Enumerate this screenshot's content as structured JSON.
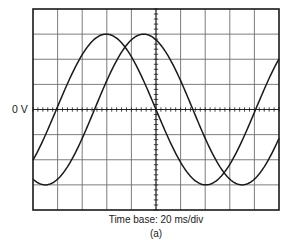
{
  "figure": {
    "zero_axis_label": "0 V",
    "timebase_caption": "Time base: 20 ms/div",
    "figure_label": "(a)"
  },
  "colors": {
    "background": "#ffffff",
    "frame": "#1a1a1a",
    "grid": "#6e6e6e",
    "trace": "#1a1a1a"
  },
  "screen": {
    "x": 33,
    "y": 9,
    "width": 246,
    "height": 201,
    "divisions_x": 10,
    "divisions_y": 8,
    "minor_ticks_per_division": 5
  },
  "chart_data": {
    "type": "line",
    "title": "",
    "xlabel": "Time base: 20 ms/div",
    "ylabel": "0 V",
    "x_unit": "divisions (20 ms/div)",
    "y_unit": "divisions",
    "xlim": [
      0,
      10
    ],
    "ylim": [
      -4,
      4
    ],
    "grid": true,
    "time_per_division_ms": 20,
    "series": [
      {
        "name": "Trace 1 (leading)",
        "amplitude_div": 3.0,
        "period_div": 8.1,
        "period_ms": 162,
        "zero_crossings_rising_div": [
          0.95,
          9.0
        ],
        "zero_crossings_falling_div": [
          5.0
        ],
        "peak_div": [
          3.0
        ],
        "trough_div": [
          6.95
        ],
        "x": [
          0,
          0.5,
          0.95,
          1.5,
          2,
          2.5,
          3,
          3.5,
          4,
          4.5,
          5,
          5.5,
          6,
          6.5,
          6.95,
          7.5,
          8,
          8.5,
          9,
          9.5,
          10
        ],
        "y": [
          -2.0,
          -1.0,
          0.0,
          1.2,
          2.1,
          2.75,
          3.0,
          2.8,
          2.2,
          1.25,
          0.0,
          -1.15,
          -2.15,
          -2.8,
          -3.0,
          -2.75,
          -2.1,
          -1.2,
          0.0,
          1.15,
          2.1
        ]
      },
      {
        "name": "Trace 2 (lagging)",
        "amplitude_div": 3.0,
        "period_div": 8.0,
        "period_ms": 160,
        "zero_crossings_rising_div": [
          2.5
        ],
        "zero_crossings_falling_div": [
          6.6
        ],
        "peak_div": [
          4.6
        ],
        "trough_div": [
          0.7,
          8.4
        ],
        "x": [
          0,
          0.35,
          0.7,
          1.2,
          1.8,
          2.5,
          3.0,
          3.5,
          4.0,
          4.6,
          5.2,
          5.8,
          6.6,
          7.2,
          7.8,
          8.4,
          9.0,
          9.5,
          10
        ],
        "y": [
          -2.6,
          -2.9,
          -3.0,
          -2.75,
          -1.85,
          0.0,
          1.3,
          2.3,
          2.85,
          3.0,
          2.75,
          1.95,
          0.0,
          -1.5,
          -2.6,
          -3.0,
          -2.75,
          -2.15,
          -1.25
        ]
      }
    ],
    "phase_difference_div": 1.6,
    "phase_difference_deg_approx": 72
  }
}
